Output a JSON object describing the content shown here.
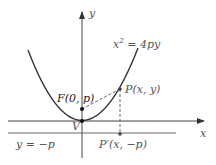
{
  "diagram": {
    "axes": {
      "x_label": "x",
      "y_label": "y"
    },
    "equation": {
      "lhs": "x",
      "exp": "2",
      "rhs": " = 4py"
    },
    "points": {
      "focus": "F(0, p)",
      "vertex": "V",
      "point": "P(x, y)",
      "projection": "P′(x, −p)"
    },
    "directrix": "y = −p",
    "colors": {
      "curve": "#333333",
      "axis": "#444444",
      "text": "#555555",
      "dashed": "#555555"
    }
  }
}
